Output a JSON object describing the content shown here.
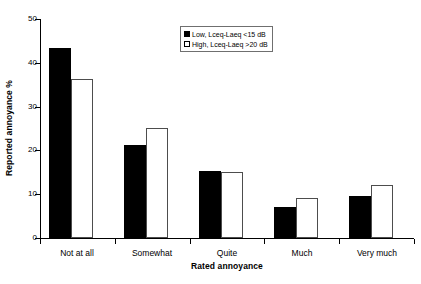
{
  "chart_data": {
    "type": "bar",
    "title": "",
    "xlabel": "Rated annoyance",
    "ylabel": "Reported annoyance %",
    "categories": [
      "Not at all",
      "Somewhat",
      "Quite",
      "Much",
      "Very much"
    ],
    "series": [
      {
        "name": "Low, Lceq-Laeq <15 dB",
        "key": "low",
        "color": "#000000",
        "values": [
          43.3,
          21.2,
          15.4,
          7.1,
          9.6
        ]
      },
      {
        "name": "High, Lceq-Laeq >20 dB",
        "key": "high",
        "color": "#ffffff",
        "values": [
          36.2,
          25.0,
          15.0,
          9.1,
          12.0
        ]
      }
    ],
    "ylim": [
      0,
      50
    ],
    "yticks": [
      0,
      10,
      20,
      30,
      40,
      50
    ],
    "ytick_labels": [
      "0",
      "10",
      "20",
      "30",
      "40",
      "50"
    ],
    "grid": false,
    "legend_position": "top-right"
  },
  "legend": {
    "entries": [
      {
        "label": "Low, Lceq-Laeq <15 dB",
        "swatch": "filled-black-square"
      },
      {
        "label": "High, Lceq-Laeq >20 dB",
        "swatch": "open-white-square"
      }
    ]
  },
  "axes": {
    "y_title": "Reported annoyance %",
    "x_title": "Rated annoyance"
  }
}
